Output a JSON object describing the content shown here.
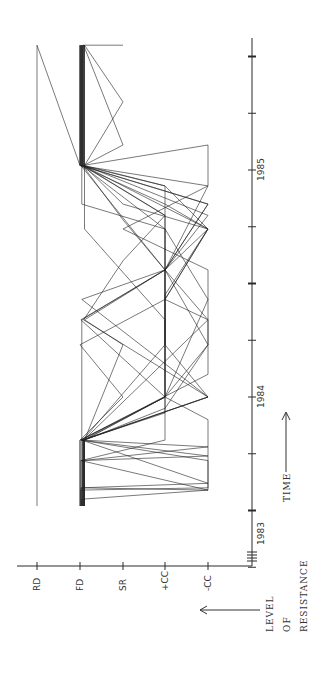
{
  "chart_data": {
    "type": "line",
    "orientation": "rotated-90-ccw",
    "title": "",
    "xlabel": "TIME",
    "ylabel": "LEVEL OF RESISTANCE",
    "x_ticks": [
      {
        "t": 1983.0,
        "label": "1983"
      },
      {
        "t": 1983.25,
        "label": ""
      },
      {
        "t": 1983.5,
        "label": ""
      },
      {
        "t": 1983.75,
        "label": ""
      },
      {
        "t": 1984.0,
        "label": "1984"
      },
      {
        "t": 1984.25,
        "label": ""
      },
      {
        "t": 1984.5,
        "label": ""
      },
      {
        "t": 1984.75,
        "label": ""
      },
      {
        "t": 1985.0,
        "label": "1985"
      },
      {
        "t": 1985.25,
        "label": ""
      },
      {
        "t": 1985.5,
        "label": ""
      }
    ],
    "y_categories": [
      "-CC",
      "+CC",
      "SR",
      "FD",
      "RD"
    ],
    "xlim": [
      1983.0,
      1985.6
    ],
    "axis_break_at_origin": true,
    "grid": false,
    "legend": null,
    "series": [
      {
        "name": "case-1",
        "points": [
          [
            1983.52,
            4
          ],
          [
            1985.55,
            4
          ],
          [
            1985.02,
            3
          ],
          [
            1985.55,
            3
          ]
        ]
      },
      {
        "name": "case-2",
        "points": [
          [
            1983.52,
            3
          ],
          [
            1983.6,
            3
          ],
          [
            1983.59,
            0
          ],
          [
            1983.72,
            3
          ],
          [
            1983.81,
            1
          ],
          [
            1984.0,
            1
          ],
          [
            1984.34,
            3
          ],
          [
            1984.56,
            1
          ],
          [
            1984.85,
            0
          ],
          [
            1985.02,
            3
          ],
          [
            1985.55,
            3
          ]
        ]
      },
      {
        "name": "case-3",
        "points": [
          [
            1983.52,
            3
          ],
          [
            1983.55,
            3
          ],
          [
            1983.59,
            0
          ],
          [
            1983.9,
            0
          ],
          [
            1984.0,
            1
          ],
          [
            1984.43,
            0
          ],
          [
            1984.74,
            1
          ],
          [
            1985.02,
            3
          ],
          [
            1985.55,
            3
          ]
        ]
      },
      {
        "name": "case-4",
        "points": [
          [
            1983.52,
            3
          ],
          [
            1983.72,
            3
          ],
          [
            1983.78,
            0
          ],
          [
            1983.81,
            3
          ],
          [
            1984.23,
            1
          ],
          [
            1984.56,
            1
          ],
          [
            1984.93,
            0
          ],
          [
            1985.11,
            0
          ],
          [
            1985.02,
            3
          ],
          [
            1985.55,
            3
          ]
        ]
      },
      {
        "name": "case-5",
        "points": [
          [
            1983.52,
            3
          ],
          [
            1983.81,
            3
          ],
          [
            1984.0,
            0
          ],
          [
            1984.34,
            3
          ],
          [
            1984.6,
            2
          ],
          [
            1984.8,
            1
          ],
          [
            1985.02,
            3
          ],
          [
            1985.55,
            3
          ]
        ]
      },
      {
        "name": "case-6",
        "points": [
          [
            1983.52,
            3
          ],
          [
            1983.81,
            3
          ],
          [
            1983.95,
            1
          ],
          [
            1984.23,
            0
          ],
          [
            1984.56,
            1
          ],
          [
            1984.74,
            0
          ],
          [
            1984.93,
            1
          ],
          [
            1985.02,
            3
          ],
          [
            1985.55,
            3
          ]
        ]
      },
      {
        "name": "case-7",
        "points": [
          [
            1983.52,
            3
          ],
          [
            1983.81,
            3
          ],
          [
            1984.0,
            2
          ],
          [
            1984.23,
            3
          ],
          [
            1984.43,
            1
          ],
          [
            1984.74,
            0
          ],
          [
            1984.85,
            1
          ],
          [
            1985.02,
            3
          ],
          [
            1985.55,
            3
          ]
        ]
      },
      {
        "name": "case-8",
        "points": [
          [
            1983.52,
            3
          ],
          [
            1983.59,
            3
          ],
          [
            1983.6,
            0
          ],
          [
            1983.72,
            0
          ],
          [
            1983.81,
            3
          ],
          [
            1984.0,
            1
          ],
          [
            1984.56,
            1
          ],
          [
            1985.02,
            3
          ],
          [
            1985.55,
            3
          ]
        ]
      },
      {
        "name": "case-9",
        "points": [
          [
            1983.52,
            3
          ],
          [
            1983.81,
            3
          ],
          [
            1984.0,
            0
          ],
          [
            1984.43,
            3
          ],
          [
            1984.56,
            1
          ],
          [
            1984.74,
            1
          ],
          [
            1984.85,
            3
          ],
          [
            1985.02,
            3
          ],
          [
            1985.55,
            3
          ]
        ]
      },
      {
        "name": "case-10",
        "points": [
          [
            1983.52,
            3
          ],
          [
            1983.81,
            3
          ],
          [
            1983.93,
            1
          ],
          [
            1984.0,
            1
          ],
          [
            1984.23,
            0
          ],
          [
            1984.34,
            0
          ],
          [
            1984.56,
            1
          ],
          [
            1984.8,
            1
          ],
          [
            1985.02,
            3
          ],
          [
            1985.55,
            3
          ]
        ]
      },
      {
        "name": "case-11",
        "points": [
          [
            1983.52,
            3
          ],
          [
            1983.81,
            3
          ],
          [
            1984.34,
            0
          ],
          [
            1984.43,
            1
          ],
          [
            1984.74,
            0
          ],
          [
            1984.85,
            2
          ],
          [
            1985.02,
            3
          ],
          [
            1985.11,
            2
          ],
          [
            1985.55,
            3
          ]
        ]
      },
      {
        "name": "case-12",
        "points": [
          [
            1983.52,
            3
          ],
          [
            1983.81,
            3
          ],
          [
            1984.0,
            1
          ],
          [
            1984.34,
            1
          ],
          [
            1984.74,
            3
          ],
          [
            1985.02,
            3
          ],
          [
            1985.3,
            2
          ],
          [
            1985.55,
            3
          ]
        ]
      },
      {
        "name": "case-13",
        "points": [
          [
            1983.52,
            3
          ],
          [
            1983.81,
            3
          ],
          [
            1984.1,
            0
          ],
          [
            1984.56,
            0
          ],
          [
            1984.74,
            2
          ],
          [
            1984.93,
            0
          ],
          [
            1985.02,
            3
          ],
          [
            1985.55,
            3
          ]
        ]
      },
      {
        "name": "case-14",
        "points": [
          [
            1983.52,
            3
          ],
          [
            1983.72,
            3
          ],
          [
            1983.74,
            0
          ],
          [
            1983.81,
            3
          ],
          [
            1984.0,
            1
          ],
          [
            1984.23,
            1
          ],
          [
            1984.56,
            1
          ],
          [
            1984.85,
            0
          ],
          [
            1985.02,
            3
          ],
          [
            1985.55,
            3
          ]
        ]
      },
      {
        "name": "case-15",
        "points": [
          [
            1983.52,
            3
          ],
          [
            1983.6,
            3
          ],
          [
            1983.62,
            0
          ],
          [
            1983.81,
            3
          ],
          [
            1984.34,
            3
          ],
          [
            1984.56,
            1
          ],
          [
            1984.93,
            1
          ],
          [
            1985.02,
            3
          ],
          [
            1985.55,
            3
          ]
        ]
      },
      {
        "name": "case-16",
        "points": [
          [
            1983.52,
            3
          ],
          [
            1983.81,
            3
          ],
          [
            1984.0,
            0
          ],
          [
            1984.23,
            1
          ],
          [
            1984.56,
            1
          ],
          [
            1984.78,
            2
          ],
          [
            1985.02,
            3
          ],
          [
            1985.55,
            3
          ],
          [
            1985.55,
            2
          ]
        ]
      },
      {
        "name": "case-17",
        "points": [
          [
            1983.52,
            3
          ],
          [
            1983.81,
            3
          ],
          [
            1984.0,
            1
          ],
          [
            1984.45,
            1
          ],
          [
            1984.74,
            0
          ],
          [
            1984.93,
            2
          ],
          [
            1985.02,
            3
          ],
          [
            1985.55,
            3
          ]
        ]
      },
      {
        "name": "case-18",
        "points": [
          [
            1983.52,
            3
          ],
          [
            1983.81,
            3
          ],
          [
            1984.23,
            2
          ],
          [
            1984.34,
            3
          ],
          [
            1984.56,
            1
          ],
          [
            1984.8,
            0
          ],
          [
            1985.02,
            3
          ],
          [
            1985.55,
            3
          ]
        ]
      }
    ]
  },
  "axes": {
    "time_label": "TIME",
    "level_label_lines": [
      "LEVEL",
      "OF",
      "RESISTANCE"
    ],
    "level_ticks": [
      "RD",
      "FD",
      "SR",
      "+CC",
      "-CC"
    ],
    "year_labels": [
      "1983",
      "1984",
      "1985"
    ]
  }
}
